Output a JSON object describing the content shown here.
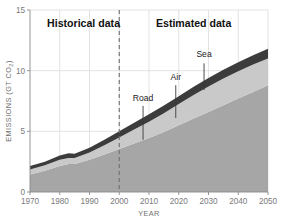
{
  "chart_data": {
    "type": "area",
    "title": "",
    "xlabel": "YEAR",
    "ylabel": "EMISSIONS (GT CO2)",
    "ylabel_main": "EMISSIONS (GT CO",
    "ylabel_sub": "2",
    "ylabel_tail": ")",
    "stacked": true,
    "grid": true,
    "legend_position": "inline-annotations",
    "xlim": [
      1970,
      2050
    ],
    "ylim": [
      0,
      15
    ],
    "xticks": [
      1970,
      1980,
      1990,
      2000,
      2010,
      2020,
      2030,
      2040,
      2050
    ],
    "yticks": [
      0,
      5,
      10,
      15
    ],
    "x": [
      1970,
      1975,
      1980,
      1983,
      1985,
      1990,
      1995,
      2000,
      2005,
      2010,
      2015,
      2020,
      2025,
      2030,
      2035,
      2040,
      2045,
      2050
    ],
    "series": [
      {
        "name": "Road",
        "color": "#a6a6a6",
        "values": [
          1.45,
          1.75,
          2.15,
          2.3,
          2.3,
          2.65,
          3.1,
          3.55,
          4.0,
          4.45,
          4.95,
          5.5,
          6.05,
          6.6,
          7.15,
          7.7,
          8.25,
          8.8
        ]
      },
      {
        "name": "Air",
        "color": "#c9c9c9",
        "values": [
          0.4,
          0.45,
          0.5,
          0.5,
          0.5,
          0.6,
          0.75,
          0.95,
          1.15,
          1.35,
          1.55,
          1.75,
          1.95,
          2.1,
          2.2,
          2.25,
          2.25,
          2.2
        ]
      },
      {
        "name": "Sea",
        "color": "#3c3c3c",
        "values": [
          0.3,
          0.3,
          0.35,
          0.4,
          0.35,
          0.4,
          0.45,
          0.5,
          0.55,
          0.6,
          0.62,
          0.65,
          0.68,
          0.7,
          0.72,
          0.75,
          0.78,
          0.8
        ]
      }
    ],
    "totals": [
      2.15,
      2.5,
      3.0,
      3.2,
      3.15,
      3.65,
      4.3,
      5.0,
      5.7,
      6.4,
      7.12,
      7.9,
      8.68,
      9.4,
      10.07,
      10.7,
      11.28,
      11.8
    ],
    "divider": {
      "x": 2000,
      "style": "dashed",
      "color": "#6e6e70"
    },
    "regions": [
      {
        "name": "historical",
        "label": "Historical data",
        "x_center": 1988
      },
      {
        "name": "estimated",
        "label": "Estimated data",
        "x_center": 2025
      }
    ],
    "annotations": [
      {
        "name": "road",
        "label": "Road",
        "x": 2008,
        "label_y": 7.5,
        "leader_top": 7.1,
        "leader_bottom": 4.3
      },
      {
        "name": "air",
        "label": "Air",
        "x": 2019,
        "label_y": 9.2,
        "leader_top": 8.8,
        "leader_bottom": 6.1
      },
      {
        "name": "sea",
        "label": "Sea",
        "x": 2028.5,
        "label_y": 11.1,
        "leader_top": 10.6,
        "leader_bottom": 8.4
      }
    ]
  },
  "colors": {
    "road": "#a6a6a6",
    "air": "#c9c9c9",
    "sea": "#3c3c3c",
    "grid": "#dcdcde",
    "axis": "#8a8a8c",
    "tick_text": "#7a7a7c",
    "background": "#ffffff"
  }
}
